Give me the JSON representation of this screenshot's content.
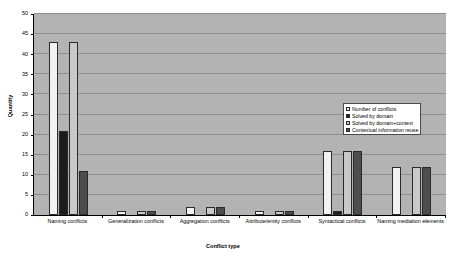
{
  "chart_data": {
    "type": "bar",
    "title": "",
    "xlabel": "Conflict type",
    "ylabel": "Quantity",
    "ylim": [
      0,
      50
    ],
    "yticks": [
      0,
      5,
      10,
      15,
      20,
      25,
      30,
      35,
      40,
      45,
      50
    ],
    "grid": true,
    "legend_position": "right",
    "categories": [
      "Naming conflicts",
      "Generalization conflicts",
      "Aggregation conflicts",
      "Attribute/entity conflicts",
      "Syntactical conflicts",
      "Naming mediation elements"
    ],
    "series": [
      {
        "name": "Number of conflicts",
        "values": [
          43,
          1,
          2,
          1,
          16,
          12
        ]
      },
      {
        "name": "Solved by domain",
        "values": [
          21,
          0,
          0,
          0,
          1,
          0
        ]
      },
      {
        "name": "Solved by domain+context",
        "values": [
          43,
          1,
          2,
          1,
          16,
          12
        ]
      },
      {
        "name": "Contextual information reuse",
        "values": [
          11,
          1,
          2,
          1,
          16,
          12
        ]
      }
    ],
    "colors": {
      "series0": "#f2f2f2",
      "series1": "#1c1c1c",
      "series2": "#c9c9c9",
      "series3": "#4d4d4d",
      "plot_background": "#b3b3b3",
      "gridline": "#8f8f8f",
      "axis": "#000000",
      "page_background": "#ffffff"
    }
  },
  "axis": {
    "y_title": "Quantity",
    "x_title": "Conflict type",
    "y_tick_labels": [
      "0",
      "5",
      "10",
      "15",
      "20",
      "25",
      "30",
      "35",
      "40",
      "45",
      "50"
    ]
  },
  "legend": {
    "items": [
      {
        "label": "Number of conflicts",
        "swatch": "#f2f2f2"
      },
      {
        "label": "Solved by domain",
        "swatch": "#1c1c1c"
      },
      {
        "label": "Solved by domain+context",
        "swatch": "#c9c9c9"
      },
      {
        "label": "Contextual information reuse",
        "swatch": "#4d4d4d"
      }
    ]
  },
  "x_categories": [
    "Naming conflicts",
    "Generalization conflicts",
    "Aggregation conflicts",
    "Attribute/entity conflicts",
    "Syntactical conflicts",
    "Naming mediation elements"
  ]
}
